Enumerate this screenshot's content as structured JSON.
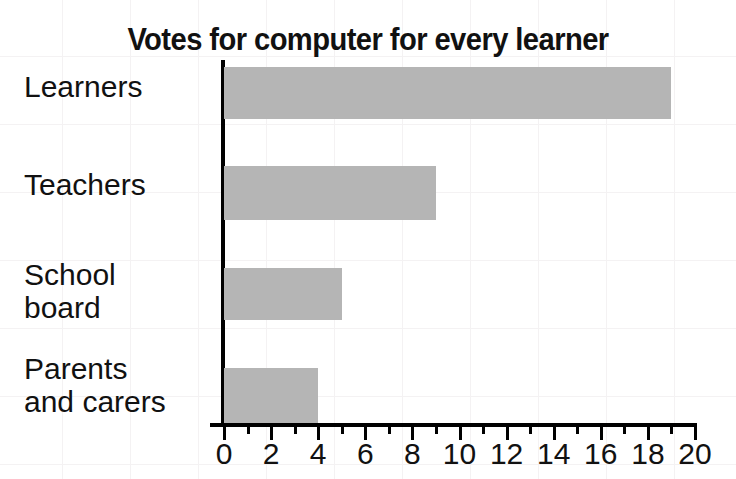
{
  "chart_data": {
    "type": "bar",
    "orientation": "horizontal",
    "title": "Votes for computer for every learner",
    "xlabel": "",
    "ylabel": "",
    "categories": [
      "Learners",
      "Teachers",
      "School\nboard",
      "Parents\nand carers"
    ],
    "values": [
      19,
      9,
      5,
      4
    ],
    "xlim": [
      0,
      20
    ],
    "xticks": [
      0,
      2,
      4,
      6,
      8,
      10,
      12,
      14,
      16,
      18,
      20
    ],
    "xtick_labels": [
      "0",
      "2",
      "4",
      "6",
      "8",
      "10",
      "12",
      "14",
      "16",
      "18",
      "20"
    ],
    "minor_tick_step": 1,
    "grid": false,
    "legend": "none",
    "bar_color": "#b5b5b5",
    "axis_color": "#000000",
    "background_color": "#ffffff",
    "grid_color": "#f4f2f3"
  }
}
